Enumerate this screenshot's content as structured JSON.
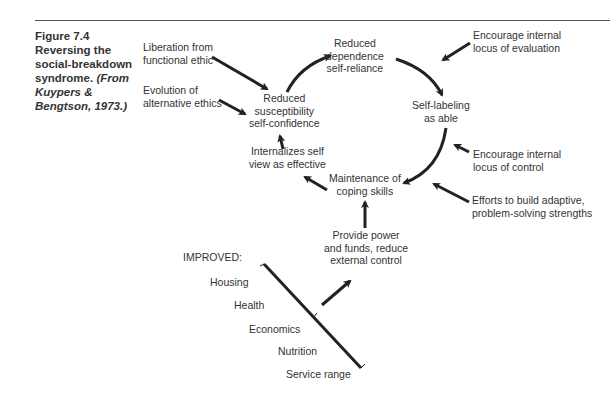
{
  "figure": {
    "number": "Figure 7.4",
    "title_lines": [
      "Reversing the",
      "social-breakdown",
      "syndrome."
    ],
    "source_lines": [
      "(From",
      "Kuypers &",
      "Bengtson, 1973.)"
    ]
  },
  "nodes": {
    "reduced_dependence": [
      "Reduced",
      "dependence",
      "self-reliance"
    ],
    "self_labeling": [
      "Self-labeling",
      "as able"
    ],
    "maintenance": [
      "Maintenance of",
      "coping skills"
    ],
    "internalizes": [
      "Internalizes self",
      "view as effective"
    ],
    "reduced_susceptibility": [
      "Reduced",
      "susceptibility",
      "self-confidence"
    ],
    "provide_power": [
      "Provide power",
      "and funds, reduce",
      "external control"
    ]
  },
  "inputs": {
    "liberation": [
      "Liberation from",
      "functional ethic"
    ],
    "evolution": [
      "Evolution of",
      "alternative ethics"
    ],
    "encourage_evaluation": [
      "Encourage internal",
      "locus of evaluation"
    ],
    "encourage_control": [
      "Encourage internal",
      "locus of control"
    ],
    "efforts": [
      "Efforts to build adaptive,",
      "problem-solving strengths"
    ]
  },
  "improved": {
    "heading": "IMPROVED:",
    "items": [
      "Housing",
      "Health",
      "Economics",
      "Nutrition",
      "Service range"
    ]
  }
}
